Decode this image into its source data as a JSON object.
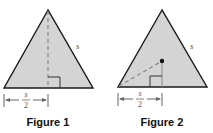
{
  "figures": [
    {
      "caption": "Figure 1",
      "side_label": "s",
      "dimension_numerator": "s",
      "dimension_denominator": "2",
      "description": "Equilateral triangle with dashed altitude from apex to base and right-angle marker; base half marked s/2"
    },
    {
      "caption": "Figure 2",
      "side_label": "s",
      "dimension_numerator": "s",
      "dimension_denominator": "2",
      "description": "Equilateral triangle with center point, dashed segment from bottom-left vertex to center, right-angle marker below center; base half marked s/2"
    }
  ],
  "colors": {
    "triangle_fill": "#d4d4d4",
    "stroke": "#1a1a1a",
    "dash": "#777777",
    "dimension": "#666666"
  }
}
